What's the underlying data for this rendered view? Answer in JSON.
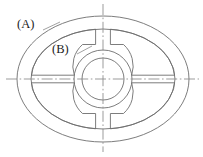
{
  "figure": {
    "type": "engineering-line-drawing",
    "background_color": "#ffffff",
    "line_color": "#6e6e6e",
    "centerline_color": "#8a8a8a",
    "label_color": "#1a1a1a"
  },
  "labels": {
    "a": "(A)",
    "b": "(B)"
  },
  "geometry": {
    "center": {
      "x": 103,
      "y": 79
    },
    "outer_ellipse": {
      "rx": 86,
      "ry": 63
    },
    "inner_ellipse": {
      "rx": 72,
      "ry": 50
    },
    "outer_circle_radius": 29,
    "inner_circle_radius": 21,
    "segment_count": 4,
    "gap_half_angle_deg": 9,
    "spoke_half_height": 4
  },
  "centerlines": {
    "horizontal": {
      "x1": 6,
      "x2": 199,
      "y": 79
    },
    "vertical": {
      "y1": 4,
      "y2": 152,
      "x": 103
    },
    "style": "dash-dot"
  }
}
